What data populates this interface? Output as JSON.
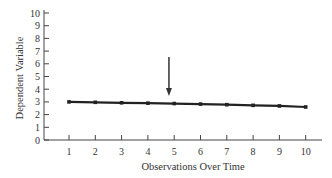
{
  "chart_data": {
    "type": "line",
    "title": "",
    "xlabel": "Observations Over Time",
    "ylabel": "Dependent Variable",
    "x": [
      1,
      2,
      3,
      4,
      5,
      6,
      7,
      8,
      9,
      10
    ],
    "series": [
      {
        "name": "Dependent Variable",
        "values": [
          3.0,
          2.97,
          2.93,
          2.9,
          2.87,
          2.83,
          2.78,
          2.73,
          2.68,
          2.6
        ],
        "color": "#222222"
      }
    ],
    "xticks": [
      "1",
      "2",
      "3",
      "4",
      "5",
      "6",
      "7",
      "8",
      "9",
      "10"
    ],
    "yticks": [
      "0",
      "1",
      "2",
      "3",
      "4",
      "5",
      "6",
      "7",
      "8",
      "9",
      "10"
    ],
    "xlim": [
      0,
      10.5
    ],
    "ylim": [
      0,
      10
    ],
    "grid": false,
    "legend": "none",
    "annotations": [
      {
        "type": "arrow",
        "x": 4.8,
        "pointing": "down",
        "description": "Arrow indicating intervention point between observations 4 and 5"
      }
    ]
  }
}
